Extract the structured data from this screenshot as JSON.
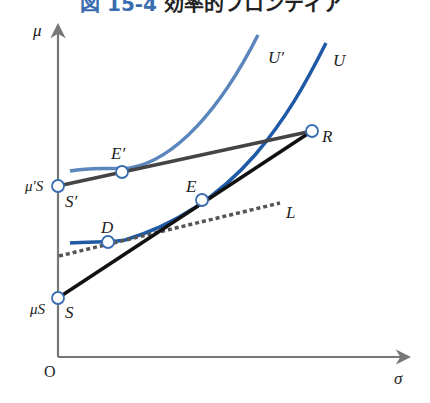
{
  "title": {
    "number": "図 15-4",
    "text": "効率的フロンティア"
  },
  "axes": {
    "y_label": "μ",
    "x_label": "σ",
    "origin_label": "O"
  },
  "points": {
    "mu_s_prime": {
      "axis_label": "μ′S",
      "point_label": "S′"
    },
    "mu_s": {
      "axis_label": "μS",
      "point_label": "S"
    },
    "R": {
      "label": "R"
    },
    "E_prime": {
      "label": "E′"
    },
    "E": {
      "label": "E"
    },
    "D": {
      "label": "D"
    }
  },
  "curves": {
    "U_prime": {
      "label": "U′",
      "color": "#5b86bd"
    },
    "U": {
      "label": "U",
      "color": "#1f5aa6"
    },
    "L": {
      "label": "L",
      "style": "dotted",
      "color": "#555555"
    },
    "SR": {
      "color": "#111111"
    },
    "SprimeR": {
      "color": "#444444"
    }
  },
  "colors": {
    "axis": "#777777",
    "point_fill": "#ffffff",
    "point_stroke": "#3a6db0"
  }
}
